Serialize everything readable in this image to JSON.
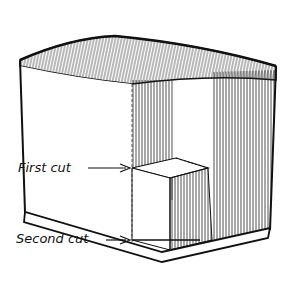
{
  "diagram": {
    "labels": {
      "first_cut": "First cut",
      "second_cut": "Second cut"
    },
    "colors": {
      "ink": "#111111",
      "paper": "#ffffff"
    }
  }
}
